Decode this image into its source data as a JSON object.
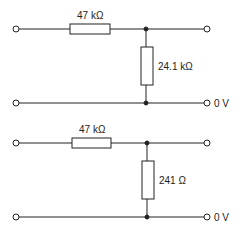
{
  "diagram": {
    "type": "potential divider circuits",
    "circuits": [
      {
        "series_resistor": "47 kΩ",
        "shunt_resistor": "24.1 kΩ",
        "ground_label": "0 V"
      },
      {
        "series_resistor": "47 kΩ",
        "shunt_resistor": "241 Ω",
        "ground_label": "0 V"
      }
    ],
    "colors": {
      "line": "#222222",
      "background": "#ffffff"
    }
  }
}
